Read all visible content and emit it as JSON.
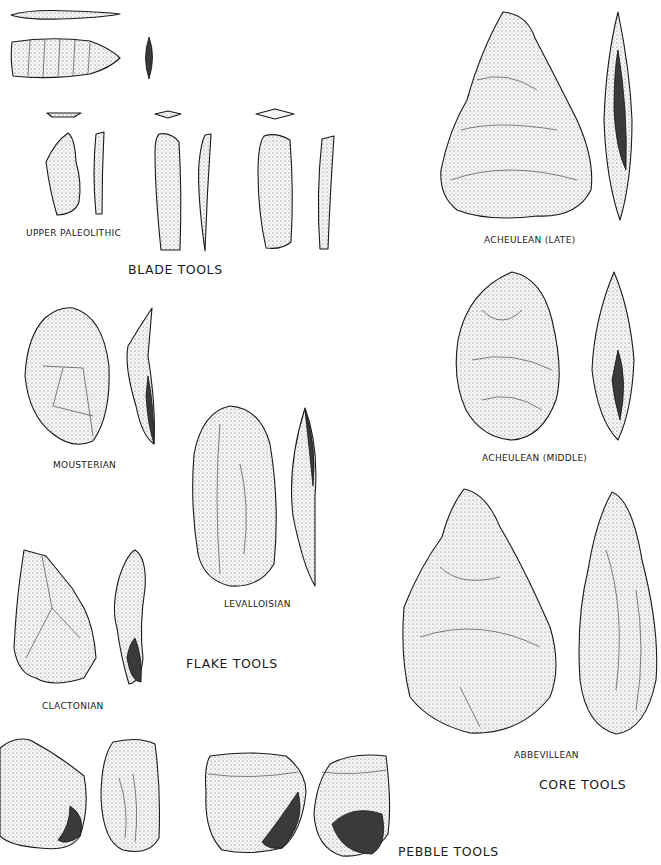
{
  "figure": {
    "groups": [
      {
        "id": "blade",
        "label": "BLADE TOOLS"
      },
      {
        "id": "flake",
        "label": "FLAKE TOOLS"
      },
      {
        "id": "core",
        "label": "CORE TOOLS"
      },
      {
        "id": "pebble",
        "label": "PEBBLE TOOLS"
      }
    ],
    "industries": {
      "upper_paleolithic": "UPPER PALEOLITHIC",
      "mousterian": "MOUSTERIAN",
      "levalloisian": "LEVALLOISIAN",
      "clactonian": "CLACTONIAN",
      "acheulean_late": "ACHEULEAN (LATE)",
      "acheulean_middle": "ACHEULEAN (MIDDLE)",
      "abbevillean": "ABBEVILLEAN"
    },
    "colors": {
      "ink": "#1a1a1a",
      "paper": "#ffffff"
    }
  }
}
